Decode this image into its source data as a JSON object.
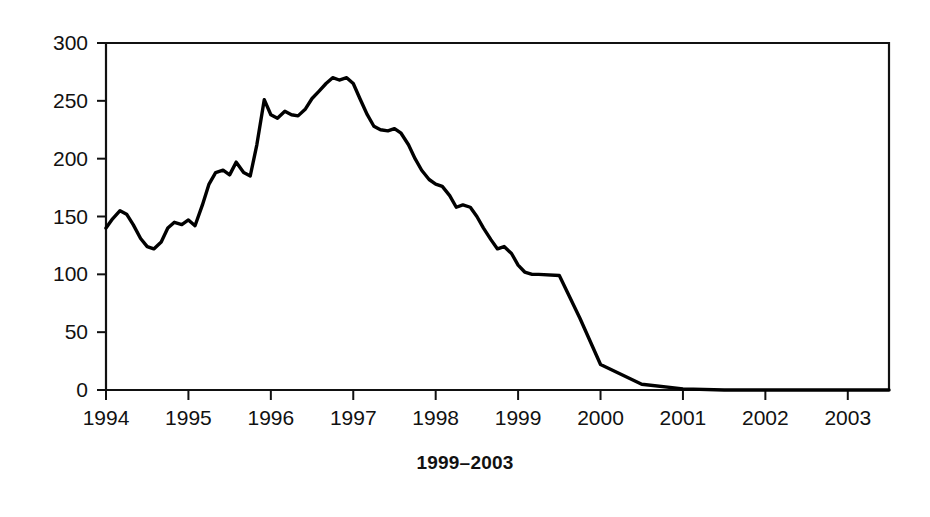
{
  "caption": "1999–2003",
  "chart_data": {
    "type": "line",
    "title": "",
    "subtitle": "",
    "xlabel": "",
    "ylabel": "",
    "xlim": [
      1994,
      1993.5
    ],
    "x_axis_range": [
      1994.0,
      2003.5
    ],
    "ylim": [
      0,
      300
    ],
    "grid": false,
    "legend": null,
    "line_color": "#000000",
    "background_color": "#ffffff",
    "axis_color": "#111111",
    "xticks": [
      "1994",
      "1995",
      "1996",
      "1997",
      "1998",
      "1999",
      "2000",
      "2001",
      "2002",
      "2003"
    ],
    "xtick_values": [
      1994,
      1995,
      1996,
      1997,
      1998,
      1999,
      2000,
      2001,
      2002,
      2003
    ],
    "yticks": [
      "0",
      "50",
      "100",
      "150",
      "200",
      "250",
      "300"
    ],
    "ytick_values": [
      0,
      50,
      100,
      150,
      200,
      250,
      300
    ],
    "series": [
      {
        "name": "series-1",
        "x": [
          1994.0,
          1994.08,
          1994.17,
          1994.25,
          1994.33,
          1994.42,
          1994.5,
          1994.58,
          1994.67,
          1994.75,
          1994.83,
          1994.92,
          1995.0,
          1995.08,
          1995.17,
          1995.25,
          1995.33,
          1995.42,
          1995.5,
          1995.58,
          1995.67,
          1995.75,
          1995.83,
          1995.92,
          1996.0,
          1996.08,
          1996.17,
          1996.25,
          1996.33,
          1996.42,
          1996.5,
          1996.58,
          1996.67,
          1996.75,
          1996.83,
          1996.92,
          1997.0,
          1997.08,
          1997.17,
          1997.25,
          1997.33,
          1997.42,
          1997.5,
          1997.58,
          1997.67,
          1997.75,
          1997.83,
          1997.92,
          1998.0,
          1998.08,
          1998.17,
          1998.25,
          1998.33,
          1998.42,
          1998.5,
          1998.58,
          1998.67,
          1998.75,
          1998.83,
          1998.92,
          1999.0,
          1999.08,
          1999.17,
          1999.25,
          1999.5,
          1999.75,
          2000.0,
          2000.5,
          2001.0,
          2001.5,
          2002.0,
          2002.5,
          2003.0,
          2003.5
        ],
        "values": [
          140,
          148,
          155,
          152,
          143,
          131,
          124,
          122,
          128,
          140,
          145,
          143,
          147,
          142,
          160,
          178,
          188,
          190,
          186,
          197,
          188,
          185,
          212,
          251,
          238,
          235,
          241,
          238,
          237,
          243,
          252,
          258,
          265,
          270,
          268,
          270,
          265,
          252,
          238,
          228,
          225,
          224,
          226,
          222,
          212,
          200,
          190,
          182,
          178,
          176,
          168,
          158,
          160,
          158,
          150,
          140,
          130,
          122,
          124,
          118,
          108,
          102,
          100,
          100,
          99,
          62,
          22,
          5,
          1,
          0,
          0,
          0,
          0,
          0
        ]
      }
    ],
    "annotations": [
      {
        "text": "peak",
        "x": 1996.25,
        "y": 270
      },
      {
        "text": "collapse-to-zero",
        "x": 1999.2,
        "y": 0
      }
    ]
  }
}
